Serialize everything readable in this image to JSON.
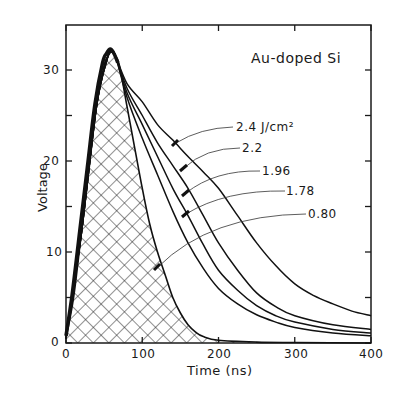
{
  "chart_data": {
    "type": "line",
    "title": "Au-doped Si",
    "xlabel": "Time (ns)",
    "ylabel": "Voltage",
    "xlim": [
      0,
      400
    ],
    "ylim": [
      0,
      34
    ],
    "xticks": [
      0,
      100,
      200,
      300,
      400
    ],
    "yticks": [
      0,
      10,
      20,
      30
    ],
    "grid": false,
    "legend_position": "inline annotations",
    "units_note": "J/cm2",
    "series": [
      {
        "name": "0.80",
        "label": "0.80",
        "hatched": true,
        "x": [
          0,
          10,
          20,
          30,
          40,
          50,
          55,
          60,
          65,
          70,
          80,
          90,
          100,
          110,
          120,
          130,
          140,
          150,
          160,
          170,
          180,
          200,
          250,
          300,
          400
        ],
        "y": [
          0.5,
          5,
          12,
          19,
          26,
          30.5,
          31.5,
          32,
          31.5,
          30.5,
          26,
          21.5,
          17,
          13,
          10,
          7.5,
          5,
          3.3,
          2,
          1.2,
          0.7,
          0.3,
          0.1,
          0.05,
          0
        ]
      },
      {
        "name": "1.78",
        "label": "1.78",
        "x": [
          0,
          20,
          40,
          55,
          60,
          65,
          80,
          100,
          120,
          140,
          160,
          180,
          200,
          225,
          250,
          275,
          300,
          350,
          400
        ],
        "y": [
          0.5,
          12,
          26,
          31.5,
          32,
          31.5,
          27,
          22.5,
          18.5,
          14.5,
          11,
          8.2,
          6,
          4.3,
          3.1,
          2.3,
          1.7,
          1.1,
          0.8
        ]
      },
      {
        "name": "1.96",
        "label": "1.96",
        "x": [
          0,
          20,
          40,
          55,
          60,
          65,
          80,
          100,
          120,
          140,
          160,
          180,
          200,
          225,
          250,
          275,
          300,
          350,
          400
        ],
        "y": [
          0.5,
          12,
          26,
          31.5,
          32,
          31.5,
          27.5,
          24,
          20.5,
          17,
          14,
          10.8,
          8,
          5.8,
          4.1,
          3,
          2.3,
          1.5,
          1.1
        ]
      },
      {
        "name": "2.2",
        "label": "2.2",
        "x": [
          0,
          20,
          40,
          55,
          60,
          65,
          80,
          100,
          120,
          140,
          160,
          180,
          200,
          225,
          250,
          275,
          300,
          350,
          400
        ],
        "y": [
          0.5,
          12,
          26,
          31.5,
          32,
          31.5,
          28,
          25,
          22,
          19.5,
          17,
          14,
          11,
          8,
          5.5,
          4,
          3,
          2,
          1.5
        ]
      },
      {
        "name": "2.4",
        "label": "2.4 J/cm²",
        "x": [
          0,
          20,
          40,
          55,
          60,
          65,
          80,
          100,
          120,
          140,
          160,
          180,
          200,
          225,
          250,
          275,
          300,
          325,
          350,
          375,
          400
        ],
        "y": [
          0.5,
          12,
          26,
          31.5,
          32,
          31.5,
          28.5,
          26.5,
          24,
          22.3,
          20.5,
          18.8,
          17,
          14,
          11,
          8.5,
          6.5,
          5.2,
          4.3,
          3.5,
          3
        ]
      }
    ]
  },
  "annotations": {
    "title": "Au-doped Si",
    "label_24": "2.4 J/cm²",
    "label_22": "2.2",
    "label_196": "1.96",
    "label_178": "1.78",
    "label_080": "0.80"
  },
  "axes": {
    "xlabel": "Time (ns)",
    "ylabel": "Voltage",
    "xtick_labels": [
      "0",
      "100",
      "200",
      "300",
      "400"
    ],
    "ytick_labels": [
      "0",
      "10",
      "20",
      "30"
    ]
  }
}
